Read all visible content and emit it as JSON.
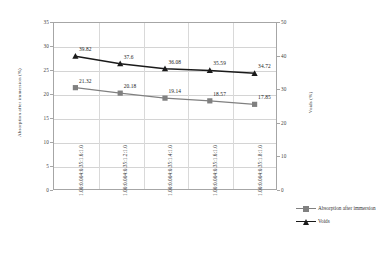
{
  "chart_data": {
    "type": "line",
    "title": "",
    "subtitle": "",
    "xlabel": "",
    "ylabel": "Absorption after immersion (%)",
    "y2label": "Voids (%)",
    "categories": [
      "1.00:0.004:0.35:1.6:1.0",
      "1.00:0.004:0.35:1.2:1.0",
      "1.00:0.004:0.35:1.4:1.0",
      "1.00:0.004:0.35:1.6:1.0",
      "1.00:0.004:0.35:1.8:1.0"
    ],
    "series": [
      {
        "name": "Absorption after immersion",
        "axis": "left",
        "marker": "square",
        "color": "#808080",
        "values": [
          21.32,
          20.18,
          19.14,
          18.57,
          17.85
        ],
        "labels": [
          "21.32",
          "20.18",
          "19.14",
          "18.57",
          "17.85"
        ]
      },
      {
        "name": "Voids",
        "axis": "right",
        "marker": "triangle",
        "color": "#1a1a1a",
        "values": [
          39.82,
          37.6,
          36.08,
          35.59,
          34.72
        ],
        "labels": [
          "39.82",
          "37.6",
          "36.08",
          "35.59",
          "34.72"
        ]
      }
    ],
    "ylim": [
      0,
      35
    ],
    "yticks": [
      "0",
      "5",
      "10",
      "15",
      "20",
      "25",
      "30",
      "35"
    ],
    "y2lim": [
      0,
      50
    ],
    "y2ticks": [
      "0",
      "10",
      "20",
      "30",
      "40",
      "50"
    ],
    "grid": true,
    "legend_position": "right",
    "legend": [
      "Absorption after immersion",
      "Voids"
    ],
    "colors": {
      "absorption": "#808080",
      "voids": "#1a1a1a",
      "grid": "#d4d4d4",
      "frame": "#a6a6a6",
      "background": "#ffffff"
    }
  }
}
